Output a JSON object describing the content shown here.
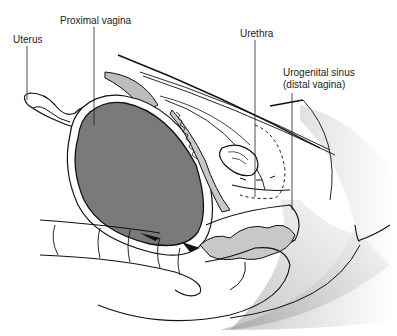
{
  "figure": {
    "type": "anatomical cross-section illustration",
    "labels": [
      {
        "id": "uterus",
        "text": "Uterus"
      },
      {
        "id": "proximal_vagina",
        "text": "Proximal vagina"
      },
      {
        "id": "urethra",
        "text": "Urethra"
      },
      {
        "id": "urogenital_sinus",
        "line1": "Urogenital sinus",
        "line2": "(distal vagina)"
      }
    ],
    "colors": {
      "line": "#111111",
      "dark_fill": "#7a7a7a",
      "light_fill": "#c8c8c8",
      "shade": "#bdbdbd",
      "background": "#ffffff"
    }
  }
}
